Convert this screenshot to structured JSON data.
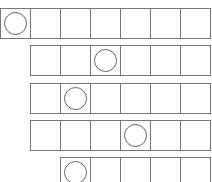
{
  "grid": {
    "cell_size": 30,
    "line_color": "#777777",
    "circle_color": "#666666",
    "rows": [
      {
        "offset_cells": 0,
        "top": 8,
        "cells": 7,
        "circle_index": 0
      },
      {
        "offset_cells": 1,
        "top": 45,
        "cells": 6,
        "circle_index": 2
      },
      {
        "offset_cells": 1,
        "top": 83,
        "cells": 6,
        "circle_index": 1
      },
      {
        "offset_cells": 1,
        "top": 120,
        "cells": 6,
        "circle_index": 3
      },
      {
        "offset_cells": 2,
        "top": 157,
        "cells": 5,
        "circle_index": 0
      }
    ]
  }
}
